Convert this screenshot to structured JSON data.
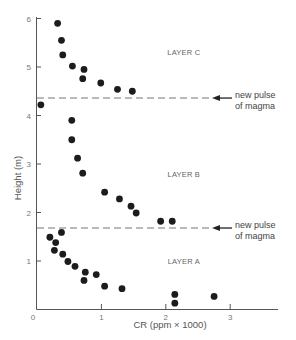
{
  "chart_data": {
    "type": "scatter",
    "title": "",
    "xlabel": "CR (ppm × 1000)",
    "ylabel": "Height (m)",
    "xlim": [
      0,
      3.3
    ],
    "ylim": [
      0,
      6
    ],
    "x_ticks": [
      "0",
      "1",
      "2",
      "3"
    ],
    "y_ticks": [
      "1",
      "2",
      "3",
      "4",
      "5",
      "6"
    ],
    "grid": false,
    "legend": null,
    "layers": [
      {
        "name": "LAYER A",
        "label_x": 2.0,
        "label_y": 1.0
      },
      {
        "name": "LAYER B",
        "label_x": 2.0,
        "label_y": 2.8
      },
      {
        "name": "LAYER C",
        "label_x": 2.0,
        "label_y": 5.3
      }
    ],
    "annotations": [
      {
        "text_line1": "new pulse",
        "text_line2": "of magma",
        "y": 4.36
      },
      {
        "text_line1": "new pulse",
        "text_line2": "of magma",
        "y": 1.68
      }
    ],
    "series": [
      {
        "name": "LAYER A",
        "points": [
          [
            0.2,
            1.49
          ],
          [
            0.38,
            1.59
          ],
          [
            0.29,
            1.38
          ],
          [
            0.27,
            1.22
          ],
          [
            0.4,
            1.14
          ],
          [
            0.48,
            0.99
          ],
          [
            0.59,
            0.89
          ],
          [
            0.75,
            0.77
          ],
          [
            0.73,
            0.6
          ],
          [
            0.92,
            0.72
          ],
          [
            1.05,
            0.48
          ],
          [
            1.32,
            0.43
          ],
          [
            2.14,
            0.31
          ],
          [
            2.14,
            0.13
          ],
          [
            2.75,
            0.27
          ]
        ]
      },
      {
        "name": "LAYER B",
        "points": [
          [
            0.54,
            3.9
          ],
          [
            0.54,
            3.5
          ],
          [
            0.63,
            3.12
          ],
          [
            0.71,
            2.81
          ],
          [
            1.05,
            2.42
          ],
          [
            1.28,
            2.28
          ],
          [
            1.46,
            2.13
          ],
          [
            1.54,
            1.99
          ],
          [
            1.92,
            1.82
          ],
          [
            2.1,
            1.82
          ]
        ]
      },
      {
        "name": "LAYER C",
        "points": [
          [
            0.06,
            4.22
          ],
          [
            0.32,
            5.9
          ],
          [
            0.38,
            5.55
          ],
          [
            0.4,
            5.25
          ],
          [
            0.55,
            5.02
          ],
          [
            0.73,
            4.95
          ],
          [
            0.71,
            4.76
          ],
          [
            0.99,
            4.67
          ],
          [
            1.25,
            4.54
          ],
          [
            1.48,
            4.5
          ]
        ]
      }
    ]
  }
}
